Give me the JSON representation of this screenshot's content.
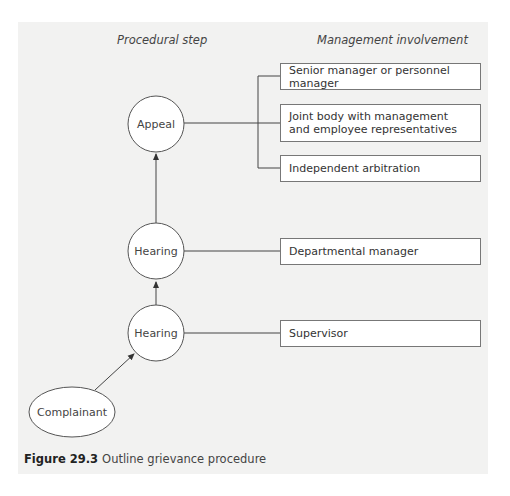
{
  "headers": {
    "procedural_step": "Procedural step",
    "management_involvement": "Management involvement"
  },
  "nodes": {
    "appeal": "Appeal",
    "hearing_upper": "Hearing",
    "hearing_lower": "Hearing",
    "complainant": "Complainant"
  },
  "management_boxes": {
    "appeal_options": [
      "Senior manager or personnel manager",
      "Joint body with management and employee representatives",
      "Independent arbitration"
    ],
    "hearing_upper": "Departmental manager",
    "hearing_lower": "Supervisor"
  },
  "caption": {
    "label": "Figure 29.3",
    "text": "Outline grievance procedure"
  },
  "colors": {
    "panel_background": "#f2f2f1",
    "line": "#444444",
    "box_border": "#777777"
  }
}
